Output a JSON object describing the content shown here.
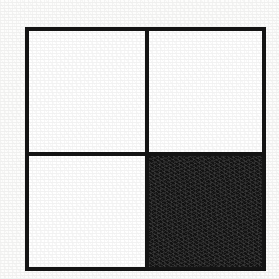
{
  "figure": {
    "style": "black-and-white line drawing, scanned",
    "background_color": "#fdfdfc",
    "stroke_color": "#141414",
    "fill_color": "#151515",
    "blank_color": "#ffffff",
    "outer_border_width_px": 4,
    "divider_width_px": 4,
    "bounds": {
      "left_px": 25,
      "top_px": 27,
      "width_px": 241,
      "height_px": 244
    },
    "dividers": [
      {
        "name": "vertical-divider",
        "orientation": "vertical",
        "position_px": 145,
        "fraction_of_width": 0.49
      },
      {
        "name": "horizontal-divider",
        "orientation": "horizontal",
        "position_px": 152,
        "fraction_of_height": 0.51
      }
    ],
    "quadrants": [
      {
        "name": "top-left",
        "row": 0,
        "col": 0,
        "fill": "white",
        "label": ""
      },
      {
        "name": "top-right",
        "row": 0,
        "col": 1,
        "fill": "white",
        "label": ""
      },
      {
        "name": "bottom-left",
        "row": 1,
        "col": 0,
        "fill": "white",
        "label": ""
      },
      {
        "name": "bottom-right",
        "row": 1,
        "col": 1,
        "fill": "black",
        "label": ""
      }
    ],
    "filled_count": 1,
    "total_count": 4
  }
}
